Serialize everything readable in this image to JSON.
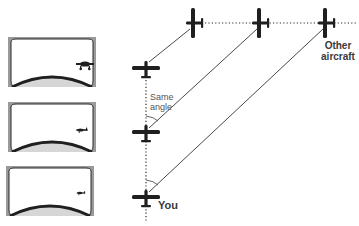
{
  "diagram": {
    "type": "collision-course illustration",
    "labels": {
      "other_aircraft": "Other aircraft",
      "same_angle": "Same angle",
      "you": "You"
    },
    "cockpit_views": [
      {
        "id": "view-1",
        "description": "Windshield view with other aircraft appearing large, near right edge"
      },
      {
        "id": "view-2",
        "description": "Windshield view with other aircraft appearing medium size, same position"
      },
      {
        "id": "view-3",
        "description": "Windshield view with other aircraft appearing small, same position"
      }
    ],
    "own_aircraft_positions": [
      {
        "x": 146,
        "y": 70
      },
      {
        "x": 146,
        "y": 134
      },
      {
        "x": 146,
        "y": 198
      }
    ],
    "other_aircraft_positions": [
      {
        "x": 194,
        "y": 23
      },
      {
        "x": 260,
        "y": 23
      },
      {
        "x": 326,
        "y": 23
      }
    ],
    "sight_lines": [
      {
        "from": [
          149,
          62
        ],
        "to": [
          190,
          29
        ]
      },
      {
        "from": [
          149,
          128
        ],
        "to": [
          257,
          29
        ]
      },
      {
        "from": [
          149,
          192
        ],
        "to": [
          323,
          29
        ]
      }
    ],
    "colors": {
      "ink": "#1f1f1f",
      "line": "#4a4a4a",
      "window_frame": "#9a9a9a",
      "dash": "#2a2a2a"
    }
  }
}
